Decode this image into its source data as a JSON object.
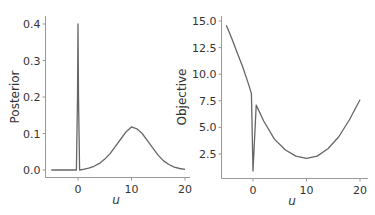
{
  "chart_data": [
    {
      "type": "line",
      "title": "",
      "xlabel": "u",
      "ylabel": "Posterior",
      "xlim": [
        -5,
        20
      ],
      "ylim": [
        0.0,
        0.4
      ],
      "xticks": [
        "0",
        "10",
        "20"
      ],
      "yticks": [
        "0.0",
        "0.1",
        "0.2",
        "0.3",
        "0.4"
      ],
      "grid": false,
      "series": [
        {
          "name": "posterior",
          "color": "#666666",
          "x": [
            -5,
            -0.3,
            -0.1,
            0,
            0.1,
            0.3,
            1,
            2,
            3,
            4,
            5,
            6,
            7,
            8,
            9,
            10,
            11,
            12,
            13,
            14,
            15,
            16,
            17,
            18,
            19,
            20
          ],
          "y": [
            0.0,
            0.0,
            0.2,
            0.4,
            0.2,
            0.0,
            0.002,
            0.005,
            0.01,
            0.018,
            0.03,
            0.045,
            0.065,
            0.085,
            0.105,
            0.118,
            0.113,
            0.1,
            0.08,
            0.06,
            0.04,
            0.025,
            0.015,
            0.008,
            0.004,
            0.002
          ]
        }
      ]
    },
    {
      "type": "line",
      "title": "",
      "xlabel": "u",
      "ylabel": "Objective",
      "xlim": [
        -5,
        20
      ],
      "ylim": [
        0.9,
        15.0
      ],
      "xticks": [
        "0",
        "10",
        "20"
      ],
      "yticks": [
        "2.5",
        "5.0",
        "7.5",
        "10.0",
        "12.5",
        "15.0"
      ],
      "grid": false,
      "series": [
        {
          "name": "objective",
          "color": "#666666",
          "x": [
            -5,
            -4,
            -3,
            -2,
            -1,
            -0.3,
            0,
            0.6,
            2,
            4,
            6,
            8,
            10,
            12,
            14,
            16,
            18,
            20
          ],
          "y": [
            14.6,
            13.4,
            12.1,
            10.8,
            9.3,
            8.2,
            0.9,
            7.1,
            5.6,
            3.9,
            2.9,
            2.3,
            2.1,
            2.3,
            3.0,
            4.1,
            5.7,
            7.6
          ]
        }
      ]
    }
  ]
}
